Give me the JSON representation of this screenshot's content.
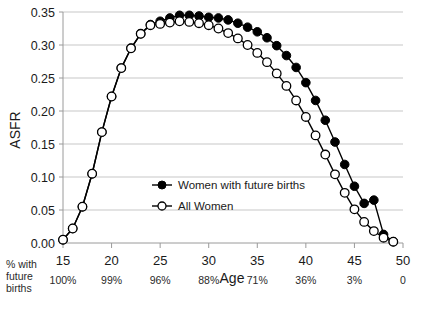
{
  "chart_data": {
    "type": "line",
    "title": "",
    "xlabel": "Age",
    "ylabel": "ASFR",
    "xlim": [
      15,
      50
    ],
    "ylim": [
      0.0,
      0.35
    ],
    "grid": true,
    "legend_position": "center-left",
    "x": [
      15,
      16,
      17,
      18,
      19,
      20,
      21,
      22,
      23,
      24,
      25,
      26,
      27,
      28,
      29,
      30,
      31,
      32,
      33,
      34,
      35,
      36,
      37,
      38,
      39,
      40,
      41,
      42,
      43,
      44,
      45,
      46,
      47,
      48,
      49
    ],
    "series": [
      {
        "name": "Women with future births",
        "marker": "filled-circle",
        "values": [
          0.005,
          0.022,
          0.055,
          0.105,
          0.168,
          0.222,
          0.265,
          0.295,
          0.317,
          0.331,
          0.336,
          0.341,
          0.345,
          0.345,
          0.344,
          0.342,
          0.341,
          0.338,
          0.333,
          0.327,
          0.32,
          0.311,
          0.299,
          0.284,
          0.266,
          0.243,
          0.216,
          0.186,
          0.153,
          0.119,
          0.086,
          0.06,
          0.065,
          0.013,
          0.002
        ]
      },
      {
        "name": "All Women",
        "marker": "open-circle",
        "values": [
          0.005,
          0.022,
          0.055,
          0.105,
          0.168,
          0.222,
          0.265,
          0.295,
          0.317,
          0.33,
          0.332,
          0.334,
          0.336,
          0.335,
          0.333,
          0.33,
          0.325,
          0.318,
          0.31,
          0.3,
          0.288,
          0.274,
          0.257,
          0.238,
          0.216,
          0.191,
          0.163,
          0.134,
          0.104,
          0.076,
          0.051,
          0.032,
          0.018,
          0.008,
          0.002
        ]
      }
    ],
    "y_ticks": [
      "0.00",
      "0.05",
      "0.10",
      "0.15",
      "0.20",
      "0.25",
      "0.30",
      "0.35"
    ],
    "y_tick_values": [
      0.0,
      0.05,
      0.1,
      0.15,
      0.2,
      0.25,
      0.3,
      0.35
    ],
    "x_ticks": [
      "15",
      "20",
      "25",
      "30",
      "35",
      "40",
      "45",
      "50"
    ],
    "x_tick_values": [
      15,
      20,
      25,
      30,
      35,
      40,
      45,
      50
    ],
    "secondary_axis": {
      "caption_lines": [
        "% with",
        "future",
        "births"
      ],
      "labels": [
        "100%",
        "99%",
        "96%",
        "88%",
        "71%",
        "36%",
        "3%",
        "0"
      ],
      "at_x": [
        15,
        20,
        25,
        30,
        35,
        40,
        45,
        50
      ]
    },
    "colors": {
      "series_line": "#000000",
      "marker_filled": "#000000",
      "marker_open": "#ffffff",
      "gridline": "#b9b9b9",
      "background": "#ffffff"
    }
  }
}
